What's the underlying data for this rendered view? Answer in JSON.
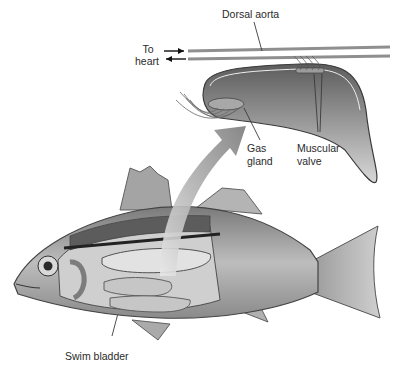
{
  "diagram": {
    "labels": {
      "dorsal_aorta": "Dorsal aorta",
      "to_heart_line1": "To",
      "to_heart_line2": "heart",
      "gas_gland_line1": "Gas",
      "gas_gland_line2": "gland",
      "muscular_valve_line1": "Muscular",
      "muscular_valve_line2": "valve",
      "swim_bladder": "Swim bladder"
    },
    "colors": {
      "line": "#3a3a3a",
      "vessel": "#9a9a9a",
      "bladder_fill": "#8c8c8c",
      "arrow": "#8a8a8a",
      "fish_body": "#9e9e9e",
      "background": "#ffffff"
    }
  }
}
